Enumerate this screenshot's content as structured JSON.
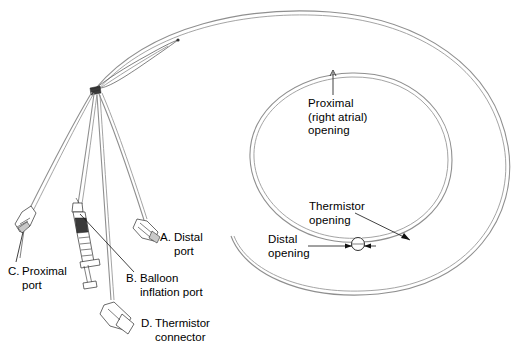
{
  "figure": {
    "background_color": "#ffffff",
    "line_color": "#000000",
    "tube_color": "#8a8a8a",
    "width": 520,
    "height": 352
  },
  "labels": {
    "a": {
      "key": "A.",
      "text": "Distal\nport"
    },
    "b": {
      "key": "B.",
      "text": "Balloon\ninflation port"
    },
    "c": {
      "key": "C.",
      "text": "Proximal\nport"
    },
    "d": {
      "key": "D.",
      "text": "Thermistor\nconnector"
    },
    "proximal_opening": {
      "text": "Proximal\n(right atrial)\nopening"
    },
    "thermistor_opening": {
      "text": "Thermistor\nopening"
    },
    "distal_opening": {
      "text": "Distal\nopening"
    }
  },
  "parts": {
    "hub": "manifold-junction",
    "syringe": "balloon-inflation-syringe",
    "balloon": "distal-balloon",
    "outer_loop": "catheter-outer-coil",
    "inner_loop": "catheter-inner-coil"
  }
}
